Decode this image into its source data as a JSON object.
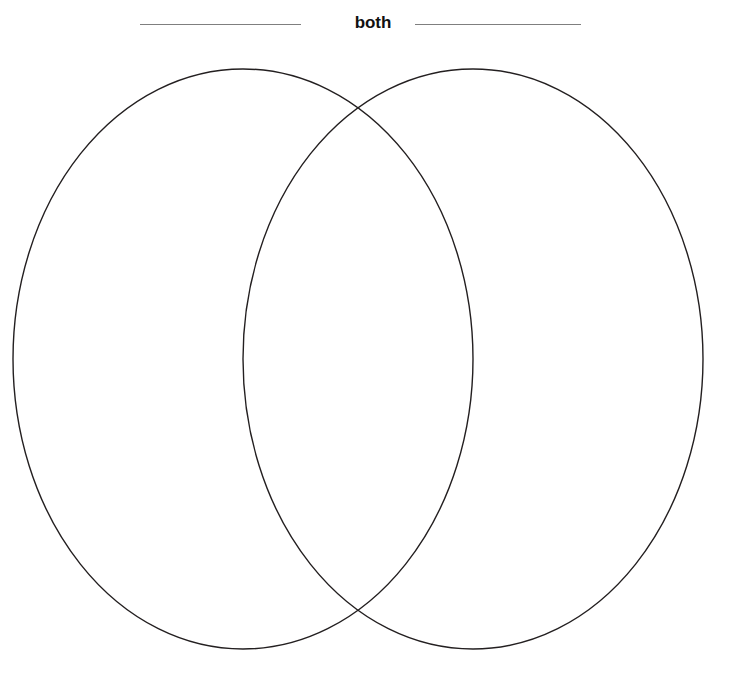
{
  "page": {
    "background_color": "#ffffff",
    "width": 746,
    "height": 676
  },
  "header": {
    "center_label": "both",
    "left_label": "",
    "right_label": "",
    "left_rule": {
      "x": 140,
      "y": 24,
      "width": 161,
      "color": "#7f7f7f"
    },
    "right_rule": {
      "x": 415,
      "y": 24,
      "width": 166,
      "color": "#7f7f7f"
    }
  },
  "diagram": {
    "type": "venn",
    "set_count": 2,
    "stroke_color": "#231f20",
    "stroke_width": 1.4,
    "fill": "none",
    "left_circle": {
      "name": "left-set",
      "label": "",
      "cx": 243,
      "cy": 359,
      "rx": 230,
      "ry": 290,
      "contents": []
    },
    "right_circle": {
      "name": "right-set",
      "label": "",
      "cx": 473,
      "cy": 359,
      "rx": 230,
      "ry": 290,
      "contents": []
    },
    "intersection": {
      "name": "both",
      "label": "both",
      "cx": 358,
      "cy": 359,
      "top_crossing": {
        "x": 358,
        "y": 108
      },
      "bottom_crossing": {
        "x": 358,
        "y": 610
      },
      "contents": []
    }
  }
}
